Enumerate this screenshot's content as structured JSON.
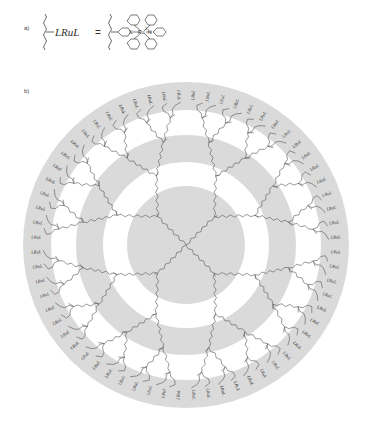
{
  "panel_a": {
    "label": "a)",
    "lhs_text": "LRuL",
    "equals": "=",
    "complex": {
      "metal": "Ru",
      "charge": "2+",
      "ligand_atom": "N",
      "description": "Ru(II) bis(terpyridine) complex attached via wavy bond"
    }
  },
  "panel_b": {
    "label": "b)",
    "terminal_label": "LRuL",
    "terminal_count": 64,
    "center": [
      186,
      245
    ],
    "rings": [
      {
        "r_outer": 163,
        "r_inner": 135,
        "color": "#dadada"
      },
      {
        "r_outer": 110,
        "r_inner": 83,
        "color": "#dadada"
      },
      {
        "r_outer": 59,
        "r_inner": 0,
        "color": "#dadada"
      }
    ],
    "core_branches": 4,
    "generations": 5
  },
  "colors": {
    "shell": "#dadada",
    "bond": "#555555",
    "text": "#333333",
    "background": "#ffffff"
  }
}
